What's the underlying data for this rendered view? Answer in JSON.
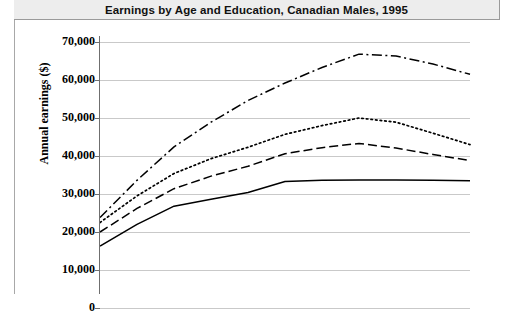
{
  "header": {
    "title": "Earnings by Age and Education, Canadian Males, 1995"
  },
  "axis": {
    "y_title": "Annual earnings ($)",
    "y_ticks": [
      {
        "label": "70,000",
        "value": 70000
      },
      {
        "label": "60,000",
        "value": 60000
      },
      {
        "label": "50,000",
        "value": 50000
      },
      {
        "label": "40,000",
        "value": 40000
      },
      {
        "label": "30,000",
        "value": 30000
      },
      {
        "label": "20,000",
        "value": 20000
      },
      {
        "label": "10,000",
        "value": 10000
      },
      {
        "label": "0",
        "value": 0
      }
    ]
  },
  "chart_data": {
    "type": "line",
    "title": "Earnings by Age and Education, Canadian Males, 1995",
    "xlabel": "",
    "ylabel": "Annual earnings ($)",
    "ylim": [
      0,
      70000
    ],
    "xlim": [
      0,
      10
    ],
    "grid": true,
    "gridline_axis": "y",
    "legend": "none",
    "note": "X axis labels are cropped off the bottom of the screenshot; x positions are age-group indices.",
    "x": [
      0,
      1,
      2,
      3,
      4,
      5,
      6,
      7,
      8,
      9,
      10
    ],
    "series": [
      {
        "name": "series-1-solid",
        "style": "solid",
        "color": "#000000",
        "values": [
          16300,
          22000,
          26800,
          28600,
          30400,
          33300,
          33600,
          33700,
          33700,
          33600,
          33500
        ]
      },
      {
        "name": "series-2-dashed",
        "style": "dashed",
        "color": "#000000",
        "values": [
          20000,
          26200,
          31400,
          34700,
          37300,
          40600,
          42200,
          43300,
          42100,
          40400,
          38800
        ]
      },
      {
        "name": "series-3-dotted",
        "style": "dotted",
        "color": "#000000",
        "values": [
          22500,
          29500,
          35400,
          39300,
          42300,
          45700,
          48000,
          50000,
          48900,
          46000,
          43000
        ]
      },
      {
        "name": "series-4-dash-dot",
        "style": "dash-dot",
        "color": "#000000",
        "values": [
          23800,
          33600,
          42400,
          48900,
          54600,
          59200,
          63300,
          66800,
          66300,
          64200,
          61500
        ]
      }
    ]
  },
  "style": {
    "title_bar_bg": "#ededed",
    "grid_color": "#c9c9c9",
    "axis_color": "#6f6f6f",
    "line_color": "#000000"
  }
}
